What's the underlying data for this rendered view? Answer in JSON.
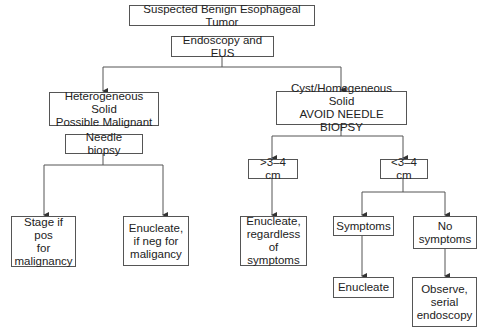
{
  "diagram": {
    "type": "flowchart",
    "nodes": {
      "root": "Suspected Benign Esophageal Tumor",
      "endoscopy": "Endoscopy and EUS",
      "heterogeneous": "Heterogeneous Solid\nPossible Malignant",
      "cyst": "Cyst/Homogeneous Solid\nAVOID NEEDLE BIOPSY",
      "needle_biopsy": "Needle biopsy",
      "stage": "Stage if pos\nfor\nmalignancy",
      "enucleate_neg": "Enucleate,\nif neg for\nmaligancy",
      "gt_size": ">3–4 cm",
      "lt_size": "<3–4 cm",
      "enucleate_regardless": "Enucleate,\nregardless\nof symptoms",
      "symptoms": "Symptoms",
      "no_symptoms": "No\nsymptoms",
      "enucleate": "Enucleate",
      "observe": "Observe,\nserial\nendoscopy"
    },
    "edges": [
      [
        "root",
        "endoscopy"
      ],
      [
        "endoscopy",
        "heterogeneous"
      ],
      [
        "endoscopy",
        "cyst"
      ],
      [
        "heterogeneous",
        "needle_biopsy"
      ],
      [
        "needle_biopsy",
        "stage"
      ],
      [
        "needle_biopsy",
        "enucleate_neg"
      ],
      [
        "cyst",
        "gt_size"
      ],
      [
        "cyst",
        "lt_size"
      ],
      [
        "gt_size",
        "enucleate_regardless"
      ],
      [
        "lt_size",
        "symptoms"
      ],
      [
        "lt_size",
        "no_symptoms"
      ],
      [
        "symptoms",
        "enucleate"
      ],
      [
        "no_symptoms",
        "observe"
      ]
    ],
    "colors": {
      "line": "#555555",
      "text": "#222222",
      "background": "#ffffff"
    }
  }
}
